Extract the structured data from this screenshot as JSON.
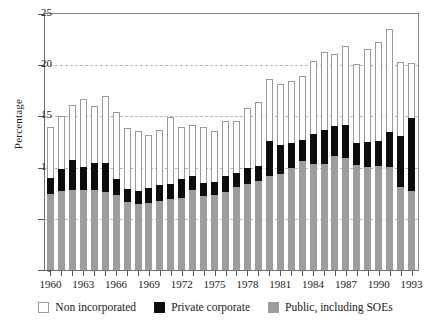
{
  "chart_data": {
    "type": "bar",
    "stacked": true,
    "title": "",
    "subtitle": "",
    "xlabel": "",
    "ylabel": "Percentage",
    "ylim": [
      0,
      25
    ],
    "yticks": [
      0,
      5,
      10,
      15,
      20,
      25
    ],
    "gridlines": [
      5,
      10,
      15,
      20
    ],
    "grid": true,
    "xlim": [
      1960,
      1993
    ],
    "xtick_labels": [
      "1960",
      "1963",
      "1966",
      "1969",
      "1972",
      "1975",
      "1978",
      "1981",
      "1984",
      "1987",
      "1990",
      "1993"
    ],
    "categories": [
      "1960",
      "1961",
      "1962",
      "1963",
      "1964",
      "1965",
      "1966",
      "1967",
      "1968",
      "1969",
      "1970",
      "1971",
      "1972",
      "1973",
      "1974",
      "1975",
      "1976",
      "1977",
      "1978",
      "1979",
      "1980",
      "1981",
      "1982",
      "1983",
      "1984",
      "1985",
      "1986",
      "1987",
      "1988",
      "1989",
      "1990",
      "1991",
      "1992",
      "1993"
    ],
    "legend_position": "bottom",
    "series": [
      {
        "name": "Public, including SOEs",
        "color": "#9d9d9d",
        "values": [
          7.4,
          7.7,
          7.8,
          7.8,
          7.8,
          7.6,
          7.3,
          6.6,
          6.4,
          6.5,
          6.7,
          6.9,
          7.0,
          7.8,
          7.2,
          7.3,
          7.6,
          8.1,
          8.4,
          8.7,
          9.2,
          9.4,
          10.0,
          10.6,
          10.4,
          10.4,
          11.1,
          10.9,
          10.3,
          10.1,
          10.2,
          10.1,
          8.1,
          7.7
        ]
      },
      {
        "name": "Private corporate",
        "color": "#0d0d0d",
        "values": [
          1.6,
          2.2,
          2.9,
          2.3,
          2.7,
          2.9,
          1.6,
          1.3,
          1.3,
          1.5,
          1.6,
          1.5,
          1.9,
          1.4,
          1.3,
          1.3,
          1.6,
          1.4,
          1.6,
          1.5,
          3.4,
          2.8,
          2.4,
          2.1,
          2.9,
          3.3,
          3.0,
          3.3,
          2.1,
          2.4,
          2.4,
          3.4,
          5.0,
          7.1
        ]
      },
      {
        "name": "Non incorporated",
        "color": "#ffffff",
        "values": [
          5.0,
          5.1,
          5.4,
          6.6,
          5.5,
          6.5,
          6.5,
          6.0,
          5.9,
          5.2,
          5.4,
          6.5,
          5.1,
          5.0,
          5.5,
          5.0,
          5.4,
          5.1,
          5.8,
          6.2,
          6.1,
          6.0,
          6.1,
          6.2,
          7.1,
          7.6,
          7.0,
          7.7,
          7.7,
          9.1,
          9.7,
          10.0,
          7.2,
          5.4
        ]
      }
    ],
    "totals": [
      14.0,
      15.0,
      16.1,
      16.7,
      16.0,
      17.0,
      15.4,
      13.9,
      13.6,
      13.2,
      13.7,
      14.9,
      14.0,
      14.2,
      14.0,
      13.6,
      14.6,
      14.6,
      15.8,
      16.4,
      18.7,
      18.2,
      18.5,
      18.9,
      20.4,
      21.3,
      21.1,
      21.9,
      20.1,
      21.6,
      22.3,
      23.5,
      20.3,
      20.2
    ],
    "colors": {
      "public": "#9d9d9d",
      "private": "#0d0d0d",
      "nonincorporated": "#ffffff",
      "axis": "#6e6e6e",
      "grid": "#b9b9b9"
    }
  },
  "legend": {
    "items": [
      {
        "label": "Non incorporated",
        "icon": "square-outline-swatch"
      },
      {
        "label": "Private corporate",
        "icon": "square-black-swatch"
      },
      {
        "label": "Public, including SOEs",
        "icon": "square-gray-swatch"
      }
    ]
  }
}
